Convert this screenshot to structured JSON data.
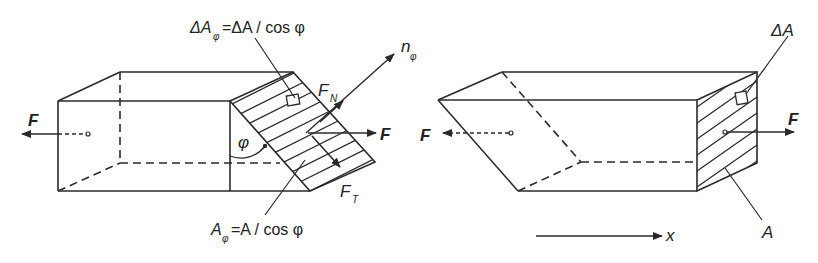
{
  "figure": {
    "colors": {
      "line": "#2a2a2a",
      "background": "#ffffff"
    },
    "left_panel": {
      "force_left": "F",
      "force_right": "F",
      "normal_label": "n",
      "normal_sub": "φ",
      "normal_force_label": "F",
      "normal_force_sub": "N",
      "tangential_force_label": "F",
      "tangential_force_sub": "T",
      "angle_label": "φ",
      "element_area_eq": {
        "lhs": "ΔA",
        "lhs_sub": "φ",
        "rhs": "=ΔA / cos φ"
      },
      "section_area_eq": {
        "lhs": "A",
        "lhs_sub": "φ",
        "rhs": "=A / cos φ"
      }
    },
    "right_panel": {
      "force_left": "F",
      "force_right": "F",
      "element_area_label": "ΔA",
      "section_area_label": "A",
      "axis_label": "x"
    }
  }
}
